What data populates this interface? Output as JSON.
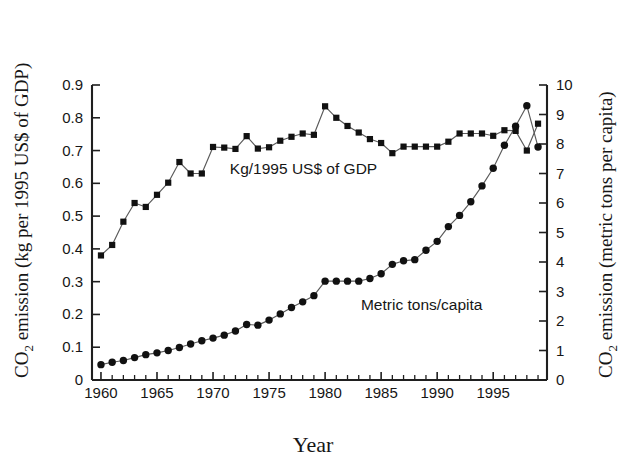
{
  "figure": {
    "background_color": "#ffffff",
    "ink_color": "#161616",
    "line_color": "#5a5a5a"
  },
  "chart_data": {
    "type": "line",
    "title": "",
    "subtitle": "",
    "xlabel": "Year",
    "ylabel": "CO2 emission (kg per 1995 US$ of GDP)",
    "ylabel_right": "CO2 emission (metric tons per capita)",
    "grid": false,
    "legend_position": "inline-annotations",
    "xlim": [
      1959.2,
      1999.8
    ],
    "ylim": [
      0,
      0.9
    ],
    "ylim_right": [
      0,
      10
    ],
    "x_major_ticks": [
      1960,
      1965,
      1970,
      1975,
      1980,
      1985,
      1990,
      1995
    ],
    "x_major_tick_labels": [
      "1960",
      "1965",
      "1970",
      "1975",
      "1980",
      "1985",
      "1990",
      "1995"
    ],
    "x_minor_tick_step": 1,
    "y_left_ticks": [
      0,
      0.1,
      0.2,
      0.3,
      0.4,
      0.5,
      0.6,
      0.7,
      0.8,
      0.9
    ],
    "y_left_tick_labels": [
      "0",
      "0.1",
      "0.2",
      "0.3",
      "0.4",
      "0.5",
      "0.6",
      "0.7",
      "0.8",
      "0.9"
    ],
    "y_right_ticks": [
      0,
      1,
      2,
      3,
      4,
      5,
      6,
      7,
      8,
      9,
      10
    ],
    "y_right_tick_labels": [
      "0",
      "1",
      "2",
      "3",
      "4",
      "5",
      "6",
      "7",
      "8",
      "9",
      "10"
    ],
    "x": [
      1960,
      1961,
      1962,
      1963,
      1964,
      1965,
      1966,
      1967,
      1968,
      1969,
      1970,
      1971,
      1972,
      1973,
      1974,
      1975,
      1976,
      1977,
      1978,
      1979,
      1980,
      1981,
      1982,
      1983,
      1984,
      1985,
      1986,
      1987,
      1988,
      1989,
      1990,
      1991,
      1992,
      1993,
      1994,
      1995,
      1996,
      1997,
      1998,
      1999
    ],
    "series": [
      {
        "name": "Kg/1995 US$ of GDP",
        "axis": "left",
        "marker": "square",
        "annotation": "Kg/1995 US$ of GDP",
        "annotation_x": 1971.5,
        "annotation_y": 0.645,
        "values": [
          0.38,
          0.412,
          0.483,
          0.54,
          0.528,
          0.565,
          0.602,
          0.665,
          0.63,
          0.63,
          0.711,
          0.709,
          0.705,
          0.744,
          0.706,
          0.71,
          0.73,
          0.742,
          0.752,
          0.748,
          0.835,
          0.8,
          0.775,
          0.755,
          0.735,
          0.723,
          0.692,
          0.712,
          0.712,
          0.712,
          0.712,
          0.727,
          0.752,
          0.752,
          0.752,
          0.745,
          0.762,
          0.76,
          0.7,
          0.782
        ]
      },
      {
        "name": "Metric tons/capita",
        "axis": "right",
        "marker": "circle",
        "annotation": "Metric tons/capita",
        "annotation_x": 1983.2,
        "annotation_y": 2.55,
        "values": [
          0.52,
          0.6,
          0.66,
          0.76,
          0.86,
          0.92,
          1.0,
          1.1,
          1.22,
          1.33,
          1.42,
          1.52,
          1.66,
          1.88,
          1.86,
          2.03,
          2.24,
          2.46,
          2.65,
          2.86,
          3.35,
          3.35,
          3.35,
          3.35,
          3.44,
          3.6,
          3.92,
          4.04,
          4.08,
          4.4,
          4.7,
          5.2,
          5.58,
          6.04,
          6.58,
          7.18,
          7.96,
          8.6,
          9.3,
          7.9
        ]
      }
    ]
  },
  "annotations": {
    "series_left_label": "Kg/1995 US$ of GDP",
    "series_right_label": "Metric tons/capita"
  },
  "axis_titles": {
    "left_prefix": "CO",
    "left_sub": "2",
    "left_rest": " emission (kg per 1995 US$ of GDP)",
    "right_prefix": "CO",
    "right_sub": "2",
    "right_rest": " emission (metric tons per capita)",
    "bottom": "Year"
  }
}
